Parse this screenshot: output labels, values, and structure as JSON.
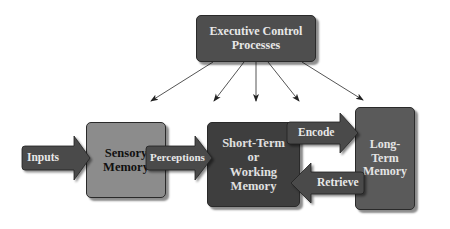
{
  "diagram": {
    "type": "memory-model-flowchart",
    "nodes": {
      "executive": {
        "label_line1": "Executive Control",
        "label_line2": "Processes"
      },
      "sensory": {
        "label_line1": "Sensory",
        "label_line2": "Memory"
      },
      "short_term": {
        "label_line1": "Short-Term",
        "label_line2": "or",
        "label_line3": "Working",
        "label_line4": "Memory"
      },
      "long_term": {
        "label_line1": "Long-Term",
        "label_line2": "Memory"
      }
    },
    "arrows": {
      "inputs": "Inputs",
      "perceptions": "Perceptions",
      "encode": "Encode",
      "retrieve": "Retrieve"
    },
    "executive_arrow_count": 5,
    "colors": {
      "executive_fill": "#4e4e4e",
      "sensory_fill": "#8c8c8c",
      "short_term_fill": "#3e3e3e",
      "long_term_fill": "#5a5a5a",
      "arrow_fill": "#4a4a4a",
      "background": "#ffffff"
    }
  }
}
